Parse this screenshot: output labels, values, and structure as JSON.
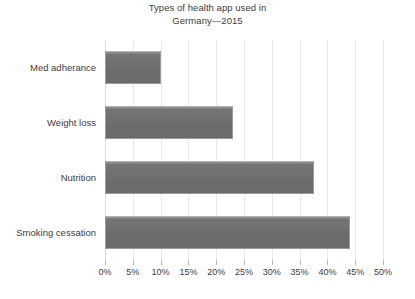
{
  "chart_data": {
    "type": "bar",
    "orientation": "horizontal",
    "title": "Types of health app used in Germany—2015",
    "title_lines": [
      "Types of health app used in",
      "Germany—2015"
    ],
    "categories": [
      "Med adherance",
      "Weight loss",
      "Nutrition",
      "Smoking cessation"
    ],
    "values": [
      10,
      23,
      37.5,
      44
    ],
    "value_unit": "%",
    "xlabel": "",
    "ylabel": "",
    "xlim": [
      0,
      50
    ],
    "xtick_step": 5,
    "xtick_labels": [
      "0%",
      "5%",
      "10%",
      "15%",
      "20%",
      "25%",
      "30%",
      "35%",
      "40%",
      "45%",
      "50%"
    ],
    "xtick_values": [
      0,
      5,
      10,
      15,
      20,
      25,
      30,
      35,
      40,
      45,
      50
    ],
    "grid": true,
    "grid_axis": "x",
    "legend": false,
    "series": [
      {
        "name": "Share of users",
        "values": [
          10,
          23,
          37.5,
          44
        ]
      }
    ],
    "bar_color": "#6e6e6e",
    "bar_border_color": "#9b9b9b",
    "grid_color": "#e9e9e9",
    "text_color": "#3d3d3d",
    "background_color": "#ffffff"
  }
}
